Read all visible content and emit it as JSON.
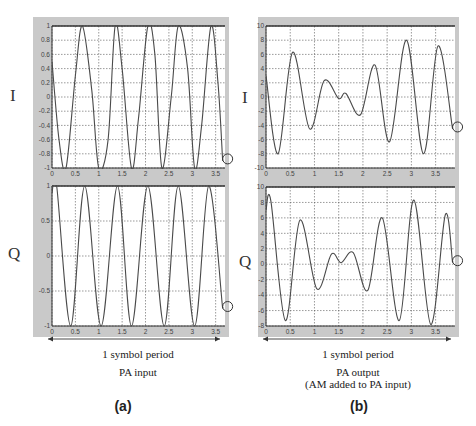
{
  "panels": [
    {
      "id": "a",
      "label": "(a)",
      "span_label": "1 symbol period",
      "caption_line1": "PA input",
      "caption_line2": ""
    },
    {
      "id": "b",
      "label": "(b)",
      "span_label": "1 symbol period",
      "caption_line1": "PA output",
      "caption_line2": "(AM added to PA input)"
    }
  ],
  "chart_data": [
    {
      "type": "line",
      "panel": "a",
      "title": "",
      "ylabel": "I",
      "xlabel": "",
      "xlim": [
        0,
        3.7
      ],
      "ylim": [
        -1,
        1
      ],
      "xticks": [
        "0",
        "0.5",
        "1",
        "1.5",
        "2",
        "2.5",
        "3",
        "3.5"
      ],
      "yticks": [
        "-1",
        "-0.8",
        "-0.6",
        "-0.4",
        "-0.2",
        "0",
        "0.2",
        "0.4",
        "0.6",
        "0.8",
        "1"
      ],
      "grid": true,
      "series": [
        {
          "name": "I (PA input)",
          "description": "constant-amplitude sinusoid, ~5 cycles over 0-3.65, amplitude 1",
          "x": [
            0,
            0.15,
            0.3,
            0.5,
            0.65,
            0.85,
            1.0,
            1.2,
            1.35,
            1.5,
            1.7,
            1.85,
            2.05,
            2.2,
            2.35,
            2.55,
            2.7,
            2.9,
            3.05,
            3.2,
            3.4,
            3.55,
            3.65
          ],
          "values": [
            0.5,
            -0.6,
            -1,
            0.3,
            1,
            0.1,
            -1,
            -0.6,
            1,
            0.4,
            -1,
            -0.3,
            1,
            0.6,
            -1,
            0,
            1,
            0.4,
            -1,
            -0.4,
            1,
            0.2,
            -0.9
          ]
        }
      ],
      "annotations": [
        "circle marker at end of trace (x≈3.65, y≈-0.85)"
      ]
    },
    {
      "type": "line",
      "panel": "a",
      "ylabel": "Q",
      "xlim": [
        0,
        3.7
      ],
      "ylim": [
        -1,
        1
      ],
      "xticks": [
        "0",
        "0.5",
        "1",
        "1.5",
        "2",
        "2.5",
        "3",
        "3.5"
      ],
      "yticks": [
        "-1",
        "-0.5",
        "0",
        "0.5",
        "1"
      ],
      "grid": true,
      "series": [
        {
          "name": "Q (PA input)",
          "description": "constant-amplitude sinusoid, amplitude 1",
          "x": [
            0,
            0.1,
            0.4,
            0.7,
            1.05,
            1.4,
            1.7,
            2.05,
            2.4,
            2.7,
            3.05,
            3.35,
            3.65
          ],
          "values": [
            0.9,
            1,
            -1,
            1,
            -1,
            1,
            -1,
            1,
            -1,
            1,
            -1,
            1,
            -0.75
          ]
        }
      ],
      "annotations": [
        "circle marker at end of trace (x≈3.65, y≈-0.75)"
      ]
    },
    {
      "type": "line",
      "panel": "b",
      "ylabel": "I",
      "xlim": [
        0,
        3.9
      ],
      "ylim": [
        -10,
        10
      ],
      "xticks": [
        "0",
        "0.5",
        "1",
        "1.5",
        "2",
        "2.5",
        "3",
        "3.5"
      ],
      "yticks": [
        "-10",
        "-8",
        "-6",
        "-4",
        "-2",
        "0",
        "2",
        "4",
        "6",
        "8",
        "10"
      ],
      "grid": true,
      "series": [
        {
          "name": "I (PA output, AM added)",
          "x": [
            0,
            0.25,
            0.55,
            0.9,
            1.2,
            1.5,
            1.65,
            1.95,
            2.25,
            2.55,
            2.9,
            3.25,
            3.55,
            3.85
          ],
          "values": [
            3,
            -8,
            6.3,
            -4.5,
            2.3,
            -0.2,
            0.5,
            -2.5,
            4.5,
            -6.3,
            8,
            -8,
            7.2,
            -4.5
          ]
        }
      ],
      "annotations": [
        "circle marker at end of trace (x≈3.85, y≈-4.5)"
      ]
    },
    {
      "type": "line",
      "panel": "b",
      "ylabel": "Q",
      "xlim": [
        0,
        3.9
      ],
      "ylim": [
        -8,
        10
      ],
      "xticks": [
        "0",
        "0.5",
        "1",
        "1.5",
        "2",
        "2.5",
        "3",
        "3.5"
      ],
      "yticks": [
        "-8",
        "-6",
        "-4",
        "-2",
        "0",
        "2",
        "4",
        "6",
        "8",
        "10"
      ],
      "grid": true,
      "series": [
        {
          "name": "Q (PA output, AM added)",
          "x": [
            0,
            0.1,
            0.4,
            0.7,
            1.05,
            1.35,
            1.55,
            1.8,
            2.1,
            2.4,
            2.75,
            3.05,
            3.4,
            3.7,
            3.85
          ],
          "values": [
            7,
            8.2,
            -7.3,
            5.7,
            -3.2,
            1.3,
            0.2,
            1.5,
            -3.4,
            6,
            -7.3,
            8.3,
            -7.8,
            6.4,
            0.2
          ]
        }
      ],
      "annotations": [
        "circle marker at end of trace (x≈3.85, y≈0)"
      ]
    }
  ]
}
